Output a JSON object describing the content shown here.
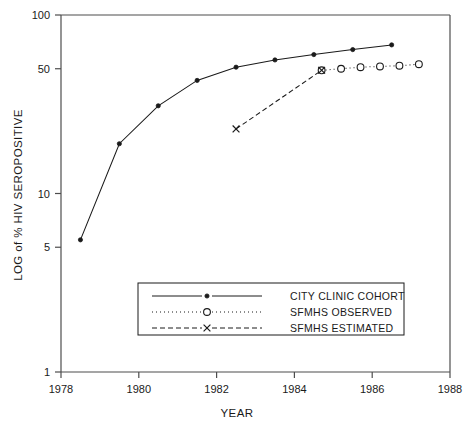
{
  "chart_data": {
    "type": "line",
    "title": "",
    "xlabel": "YEAR",
    "ylabel": "LOG of % HIV SEROPOSITIVE",
    "xlim": [
      1978,
      1988
    ],
    "ylim": [
      1,
      100
    ],
    "yscale": "log",
    "grid": false,
    "legend_position": "lower-center",
    "xticks": [
      "1978",
      "1980",
      "1982",
      "1984",
      "1986",
      "1988"
    ],
    "xtick_values": [
      1978,
      1980,
      1982,
      1984,
      1986,
      1988
    ],
    "yticks": [
      "100",
      "50",
      "10",
      "5",
      "1"
    ],
    "ytick_values": [
      100,
      50,
      10,
      5,
      1
    ],
    "series": [
      {
        "name": "CITY CLINIC COHORT",
        "marker": "dot",
        "linestyle": "solid",
        "color": "#1a1a1a",
        "x": [
          1978.5,
          1979.5,
          1980.5,
          1981.5,
          1982.5,
          1983.5,
          1984.5,
          1985.5,
          1986.5
        ],
        "y": [
          5.5,
          19,
          31,
          43,
          51,
          56,
          60,
          64,
          68
        ]
      },
      {
        "name": "SFMHS OBSERVED",
        "marker": "circle",
        "linestyle": "dotted",
        "color": "#1a1a1a",
        "x": [
          1984.7,
          1985.2,
          1985.7,
          1986.2,
          1986.7,
          1987.2
        ],
        "y": [
          49,
          50,
          51,
          51.5,
          52,
          53
        ]
      },
      {
        "name": "SFMHS ESTIMATED",
        "marker": "x",
        "linestyle": "dashed",
        "color": "#1a1a1a",
        "x": [
          1982.5,
          1984.7
        ],
        "y": [
          23,
          49
        ]
      }
    ]
  },
  "legend": {
    "entries": [
      {
        "label": "CITY CLINIC COHORT",
        "marker": "dot",
        "linestyle": "solid"
      },
      {
        "label": "SFMHS OBSERVED",
        "marker": "circle",
        "linestyle": "dotted"
      },
      {
        "label": "SFMHS ESTIMATED",
        "marker": "x",
        "linestyle": "dashed"
      }
    ]
  }
}
